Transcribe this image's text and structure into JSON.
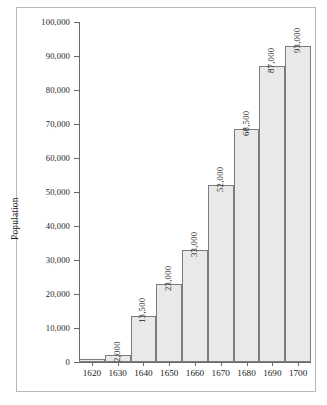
{
  "chart_data": {
    "type": "bar",
    "title": "",
    "subtitle": "",
    "xlabel": "",
    "ylabel": "Population",
    "categories": [
      "1620",
      "1630",
      "1640",
      "1650",
      "1660",
      "1670",
      "1680",
      "1690",
      "1700"
    ],
    "values": [
      1000,
      2000,
      13500,
      23000,
      33000,
      52000,
      68500,
      87000,
      93000
    ],
    "data_labels": [
      "",
      "2,000",
      "13,500",
      "23,000",
      "33,000",
      "52,000",
      "68,500",
      "87,000",
      "93,000"
    ],
    "ylim": [
      0,
      100000
    ],
    "xlim_note": "categorical decades 1620-1700",
    "y_ticks": [
      0,
      10000,
      20000,
      30000,
      40000,
      50000,
      60000,
      70000,
      80000,
      90000,
      100000
    ],
    "y_tick_labels": [
      "0",
      "10,000",
      "20,000",
      "30,000",
      "40,000",
      "50,000",
      "60,000",
      "70,000",
      "80,000",
      "90,000",
      "100,000"
    ],
    "grid": false,
    "legend": null,
    "legend_position": "none",
    "bar_fill_color": "#e9e9e9",
    "bar_edge_color": "#7c7c7c",
    "axis_color": "#6b6b6b",
    "frame_color": "#b9b9b9",
    "text_color": "#1b1b1b",
    "background_color": "#ffffff",
    "data_label_rotation": -90
  }
}
